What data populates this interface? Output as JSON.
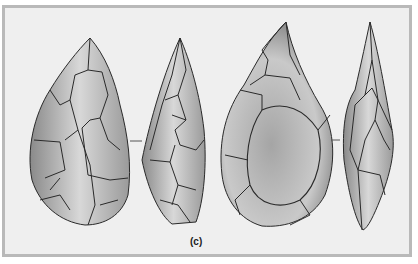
{
  "figure": {
    "label": "(c)",
    "items": [
      {
        "name": "handaxe-1-face-view"
      },
      {
        "name": "handaxe-1-side-view"
      },
      {
        "name": "handaxe-2-face-view"
      },
      {
        "name": "handaxe-2-side-view"
      }
    ],
    "colors": {
      "background": "#efefef",
      "border": "#b9b9b9",
      "stroke": "#2a2a2a"
    }
  }
}
